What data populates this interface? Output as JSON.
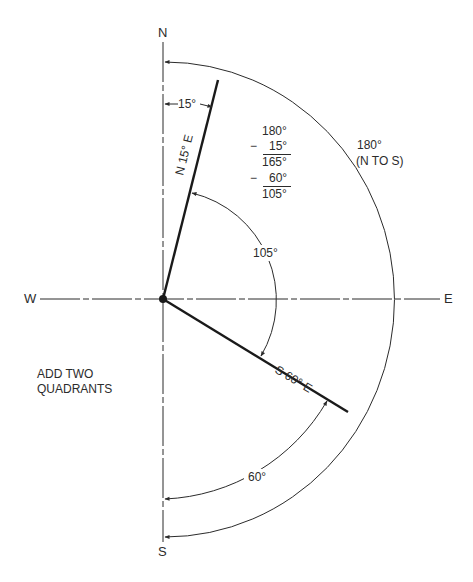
{
  "diagram": {
    "compass": {
      "north": "N",
      "south": "S",
      "east": "E",
      "west": "W"
    },
    "bearings": [
      {
        "label": "N 15° E",
        "angle_from_north_deg": 15
      },
      {
        "label": "S 60° E",
        "angle_from_south_deg": 60
      }
    ],
    "angles": {
      "offset_north": "15°",
      "between_bearings": "105°",
      "offset_south": "60°",
      "half_circle": "180°",
      "half_circle_note": "(N TO S)"
    },
    "calculation": {
      "line1": "180°",
      "line2_op": "−",
      "line2": "15°",
      "line3": "165°",
      "line4_op": "−",
      "line4": "60°",
      "line5": "105°"
    },
    "note": {
      "line1": "ADD TWO",
      "line2": "QUADRANTS"
    },
    "colors": {
      "ink": "#2b2b2b",
      "background": "#ffffff"
    }
  }
}
